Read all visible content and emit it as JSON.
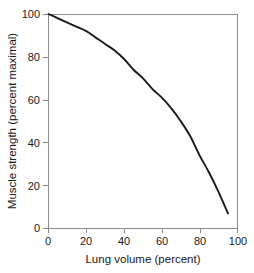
{
  "chart_data": {
    "type": "line",
    "title": "",
    "xlabel": "Lung volume (percent)",
    "ylabel": "Muscle strength (percent maximal)",
    "xlim": [
      0,
      100
    ],
    "ylim": [
      0,
      100
    ],
    "xticks": [
      0,
      20,
      40,
      60,
      80,
      100
    ],
    "yticks": [
      0,
      20,
      40,
      60,
      80,
      100
    ],
    "xticklabels": [
      "0",
      "20",
      "40",
      "60",
      "80",
      "100"
    ],
    "yticklabels": [
      "0",
      "20",
      "40",
      "60",
      "80",
      "100"
    ],
    "grid": false,
    "legend": false,
    "legend_position": "none",
    "series": [
      {
        "name": "Muscle strength vs lung volume",
        "color": "#1a1a1a",
        "x": [
          0,
          5,
          10,
          15,
          20,
          25,
          30,
          35,
          40,
          45,
          50,
          55,
          60,
          65,
          70,
          75,
          80,
          85,
          90,
          95
        ],
        "y": [
          100,
          98,
          96,
          94,
          92,
          89,
          86,
          83,
          79,
          74,
          70,
          65,
          61,
          56,
          50,
          43,
          34,
          26,
          17,
          7
        ]
      }
    ],
    "axis_color": "#8c8c8c",
    "background": "#ffffff"
  }
}
